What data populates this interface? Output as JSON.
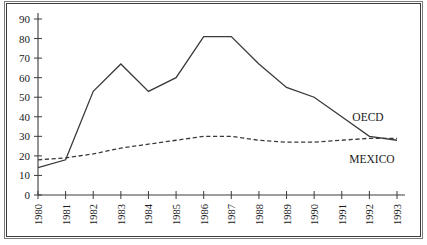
{
  "figure": {
    "caption_partial": "",
    "frame": "double-rule-box"
  },
  "chart_data": {
    "type": "line",
    "title": "",
    "xlabel": "",
    "ylabel": "",
    "categories": [
      "1980",
      "1981",
      "1982",
      "1983",
      "1984",
      "1985",
      "1986",
      "1987",
      "1988",
      "1989",
      "1990",
      "1991",
      "1992",
      "1993"
    ],
    "yticks": [
      0,
      10,
      20,
      30,
      40,
      50,
      60,
      70,
      80,
      90
    ],
    "ylim": [
      0,
      90
    ],
    "grid": false,
    "legend_position": "right-inline-labels",
    "series": [
      {
        "name": "OECD",
        "style": "solid",
        "label": "OECD",
        "values": [
          14,
          18,
          53,
          67,
          53,
          60,
          81,
          81,
          67,
          55,
          50,
          40,
          30,
          28
        ]
      },
      {
        "name": "MEXICO",
        "style": "dashed",
        "label": "MEXICO",
        "values": [
          18,
          19,
          21,
          24,
          26,
          28,
          30,
          30,
          28,
          27,
          27,
          28,
          29,
          29
        ]
      }
    ]
  },
  "colors": {
    "line": "#3a3a3a",
    "axis": "#3c3c3c",
    "frame_outer": "#7a7a7a",
    "frame_inner": "#3a3a3a",
    "background": "#ffffff",
    "text": "#1a1a1a"
  }
}
